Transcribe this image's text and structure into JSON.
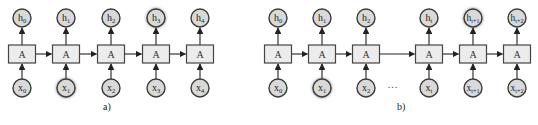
{
  "diagram": {
    "panels": [
      {
        "caption": "a)",
        "caption_pos": [
          103,
          110
        ],
        "cell_label": "A",
        "nodes": [
          {
            "cx": 22,
            "input": {
              "base": "x",
              "sub": "0"
            },
            "output": {
              "base": "h",
              "sub": "0"
            },
            "input_highlight": false,
            "output_highlight": false
          },
          {
            "cx": 66,
            "input": {
              "base": "x",
              "sub": "1"
            },
            "output": {
              "base": "h",
              "sub": "1"
            },
            "input_highlight": true,
            "output_highlight": false
          },
          {
            "cx": 111,
            "input": {
              "base": "x",
              "sub": "2"
            },
            "output": {
              "base": "h",
              "sub": "2"
            },
            "input_highlight": false,
            "output_highlight": false
          },
          {
            "cx": 156,
            "input": {
              "base": "x",
              "sub": "3"
            },
            "output": {
              "base": "h",
              "sub": "3"
            },
            "input_highlight": false,
            "output_highlight": true
          },
          {
            "cx": 200,
            "input": {
              "base": "x",
              "sub": "4"
            },
            "output": {
              "base": "h",
              "sub": "4"
            },
            "input_highlight": false,
            "output_highlight": false
          }
        ],
        "ellipsis": null
      },
      {
        "caption": "b)",
        "caption_pos": [
          397,
          110
        ],
        "cell_label": "A",
        "nodes": [
          {
            "cx": 278,
            "input": {
              "base": "x",
              "sub": "0"
            },
            "output": {
              "base": "h",
              "sub": "0"
            },
            "input_highlight": false,
            "output_highlight": false
          },
          {
            "cx": 322,
            "input": {
              "base": "x",
              "sub": "1"
            },
            "output": {
              "base": "h",
              "sub": "1"
            },
            "input_highlight": true,
            "output_highlight": false
          },
          {
            "cx": 366,
            "input": {
              "base": "x",
              "sub": "2"
            },
            "output": {
              "base": "h",
              "sub": "2"
            },
            "input_highlight": false,
            "output_highlight": false
          },
          {
            "cx": 429,
            "input": {
              "base": "x",
              "sub": "t"
            },
            "output": {
              "base": "h",
              "sub": "t"
            },
            "input_highlight": false,
            "output_highlight": false
          },
          {
            "cx": 473,
            "input": {
              "base": "x",
              "sub": "t+1"
            },
            "output": {
              "base": "h",
              "sub": "t+1"
            },
            "input_highlight": false,
            "output_highlight": true
          },
          {
            "cx": 517,
            "input": {
              "base": "x",
              "sub": "t+2"
            },
            "output": {
              "base": "h",
              "sub": "t+2"
            },
            "input_highlight": false,
            "output_highlight": false
          }
        ],
        "ellipsis": {
          "text": "...",
          "x": 393,
          "y": 88
        }
      }
    ],
    "geometry": {
      "out_cy": 18,
      "in_cy": 88,
      "radius": 9,
      "box_w": 27,
      "box_top": 45,
      "box_h": 18
    },
    "colors": {
      "node_fill": "#d9d9d9",
      "node_stroke": "#3a3a3a",
      "box_fill": "#ececec",
      "box_stroke": "#444444",
      "edge": "#222222"
    }
  }
}
